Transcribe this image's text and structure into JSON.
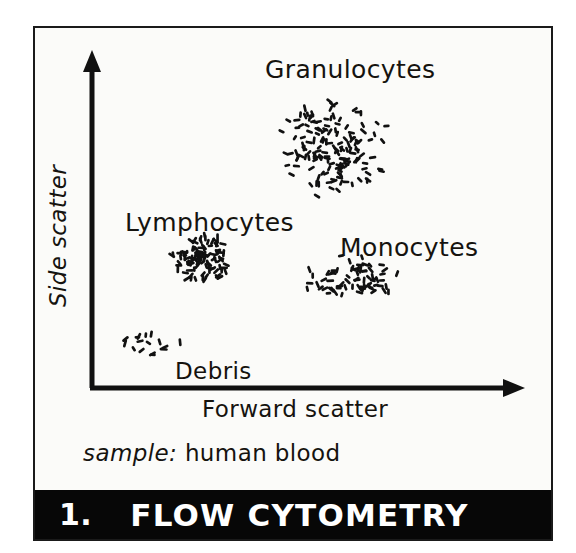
{
  "figure": {
    "number": "1.",
    "title": "FLOW CYTOMETRY",
    "caption_prefix": "sample:",
    "caption_value": " human blood",
    "background_color": "#fbfbf9",
    "ink_color": "#15130f",
    "title_bar_color": "#070707",
    "title_text_color": "#ffffff"
  },
  "axes": {
    "x_label": "Forward scatter",
    "y_label": "Side scatter",
    "x_arrow": true,
    "y_arrow": true,
    "grid": false,
    "ticks": false
  },
  "chart_data": {
    "type": "scatter",
    "title": "FLOW CYTOMETRY",
    "xlabel": "Forward scatter",
    "ylabel": "Side scatter",
    "xlim": [
      0,
      100
    ],
    "ylim": [
      0,
      100
    ],
    "grid": false,
    "legend": "none",
    "annotations": [
      {
        "text": "Granulocytes",
        "x": 60,
        "y": 92
      },
      {
        "text": "Lymphocytes",
        "x": 27,
        "y": 57
      },
      {
        "text": "Monocytes",
        "x": 70,
        "y": 51
      },
      {
        "text": "Debris",
        "x": 27,
        "y": 14
      },
      {
        "text": "sample: human blood",
        "x": 12,
        "y": -14
      }
    ],
    "series": [
      {
        "name": "Granulocytes",
        "n_points": 150,
        "shape": "round-dense",
        "center": [
          57,
          75
        ],
        "spread": [
          13,
          14
        ],
        "color": "#111111"
      },
      {
        "name": "Lymphocytes",
        "n_points": 105,
        "shape": "round-very-dense",
        "center": [
          26,
          41
        ],
        "spread": [
          7,
          7
        ],
        "color": "#111111"
      },
      {
        "name": "Monocytes",
        "n_points": 70,
        "shape": "elliptical-loose",
        "center": [
          61,
          34
        ],
        "spread": [
          12,
          7
        ],
        "color": "#111111"
      },
      {
        "name": "Debris",
        "n_points": 16,
        "shape": "sparse",
        "center": [
          14,
          14
        ],
        "spread": [
          7,
          6
        ],
        "color": "#111111"
      }
    ]
  }
}
